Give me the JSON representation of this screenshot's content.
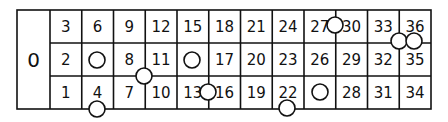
{
  "diagram": {
    "zero_label": "0",
    "rows": [
      [
        "3",
        "6",
        "9",
        "12",
        "15",
        "18",
        "21",
        "24",
        "27",
        "30",
        "33",
        "36"
      ],
      [
        "2",
        "5",
        "8",
        "11",
        "14",
        "17",
        "20",
        "23",
        "26",
        "29",
        "32",
        "35"
      ],
      [
        "1",
        "4",
        "7",
        "10",
        "13",
        "16",
        "19",
        "22",
        "25",
        "28",
        "31",
        "34"
      ]
    ],
    "hidden_numbers": [
      "5",
      "14",
      "25"
    ],
    "chips": [
      {
        "id": "straight-5",
        "cx": 97,
        "cy": 60
      },
      {
        "id": "straight-14",
        "cx": 192,
        "cy": 60
      },
      {
        "id": "straight-25",
        "cx": 320,
        "cy": 92
      },
      {
        "id": "corner-7-8-10-11",
        "cx": 144,
        "cy": 76
      },
      {
        "id": "street-4-5-6",
        "cx": 97,
        "cy": 109
      },
      {
        "id": "split-13-16",
        "cx": 208,
        "cy": 92
      },
      {
        "id": "street-22-23-24",
        "cx": 287,
        "cy": 108
      },
      {
        "id": "split-27-30",
        "cx": 335,
        "cy": 25
      },
      {
        "id": "corner-32-33-35-36",
        "cx": 399,
        "cy": 41
      },
      {
        "id": "split-35-36",
        "cx": 414,
        "cy": 41
      }
    ],
    "colors": {
      "line": "#111111",
      "background": "#ffffff"
    }
  }
}
